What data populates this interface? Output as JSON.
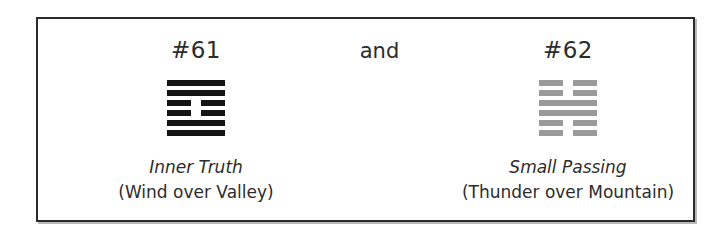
{
  "figure": {
    "conjunction_label": "and",
    "border_color": "#2b2b2b",
    "background_color": "#ffffff",
    "columns": [
      {
        "number_label": "#61",
        "name_label": "Inner Truth",
        "trigram_label": "(Wind over Valley)",
        "glyph_color": "#151515",
        "glyph_name": "hexagram-61-inner-truth",
        "lines_top_to_bottom": [
          "yang",
          "yang",
          "yin",
          "yin",
          "yang",
          "yang"
        ]
      },
      {
        "number_label": "#62",
        "name_label": "Small Passing",
        "trigram_label": "(Thunder over Mountain)",
        "glyph_color": "#9a9a9a",
        "glyph_name": "hexagram-62-small-passing",
        "lines_top_to_bottom": [
          "yin",
          "yin",
          "yang",
          "yang",
          "yin",
          "yin"
        ]
      }
    ]
  }
}
